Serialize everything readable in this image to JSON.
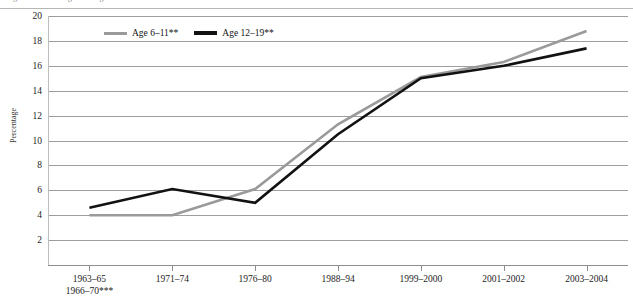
{
  "figure": {
    "top_caption_sliver": "Figure — overweight among children and adolescents",
    "y_axis_title": "Percentage"
  },
  "legend": {
    "position": "top-left-inside",
    "items": [
      {
        "label": "Age 6–11**",
        "color": "#9a9a9a",
        "weight": "thin"
      },
      {
        "label": "Age 12–19**",
        "color": "#121212",
        "weight": "thick"
      }
    ]
  },
  "chart_data": {
    "type": "line",
    "title": "",
    "subtitle": "",
    "xlabel": "",
    "ylabel": "Percentage",
    "ylim": [
      0,
      20
    ],
    "yticks": [
      2,
      4,
      6,
      8,
      10,
      12,
      14,
      16,
      18,
      20
    ],
    "ytick_labels": [
      "2",
      "4",
      "6",
      "8",
      "10",
      "12",
      "14",
      "16",
      "18",
      "20"
    ],
    "grid": true,
    "grid_axis": "y",
    "categories": [
      "1963–65\n1966–70***",
      "1971–74",
      "1976–80",
      "1988–94",
      "1999–2000",
      "2001–2002",
      "2003–2004"
    ],
    "category_lines": [
      [
        "1963–65",
        "1966–70***"
      ],
      [
        "1971–74",
        ""
      ],
      [
        "1976–80",
        ""
      ],
      [
        "1988–94",
        ""
      ],
      [
        "1999–2000",
        ""
      ],
      [
        "2001–2002",
        ""
      ],
      [
        "2003–2004",
        ""
      ]
    ],
    "series": [
      {
        "name": "Age 6–11**",
        "color": "#9a9a9a",
        "width": 2.6,
        "values": [
          4.0,
          4.0,
          6.1,
          11.3,
          15.1,
          16.3,
          18.8
        ]
      },
      {
        "name": "Age 12–19**",
        "color": "#121212",
        "width": 2.6,
        "values": [
          4.6,
          6.1,
          5.0,
          10.5,
          15.0,
          16.0,
          17.4
        ]
      }
    ],
    "annotations": [
      "** statistically significant trend",
      "*** combined survey period"
    ]
  }
}
